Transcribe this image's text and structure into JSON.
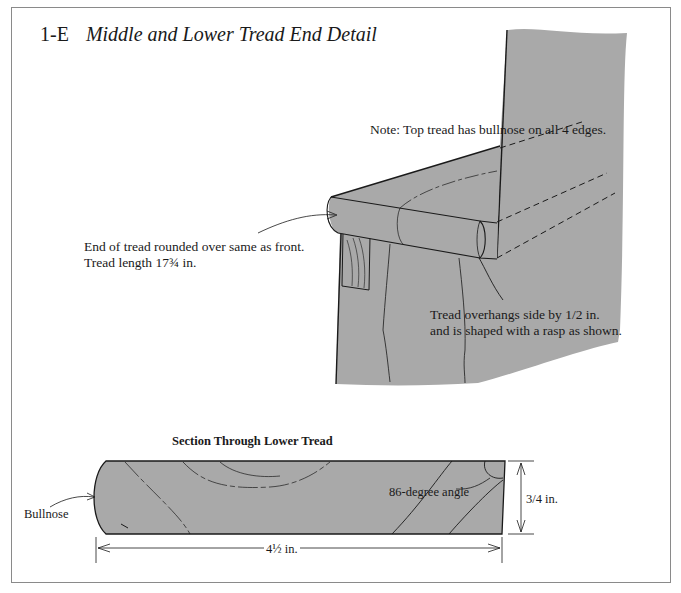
{
  "figure": {
    "number": "1-E",
    "title": "Middle and Lower Tread End Detail"
  },
  "perspective_view": {
    "note": "Note: Top tread has bullnose on all 4 edges.",
    "end_callout": {
      "line1": "End of tread rounded over same as front.",
      "line2": "Tread length 17¾ in."
    },
    "overhang_callout": {
      "line1": "Tread overhangs side by 1/2 in.",
      "line2": "and is shaped with a rasp as shown."
    }
  },
  "section_view": {
    "title": "Section Through Lower Tread",
    "bullnose_label": "Bullnose",
    "angle_label": "86-degree angle",
    "thickness_label": "3/4 in.",
    "width_label": "4½ in."
  },
  "colors": {
    "wood_fill": "#a9a9a9",
    "line": "#1a1a1a",
    "frame": "#8a8a8a",
    "background": "#ffffff"
  }
}
